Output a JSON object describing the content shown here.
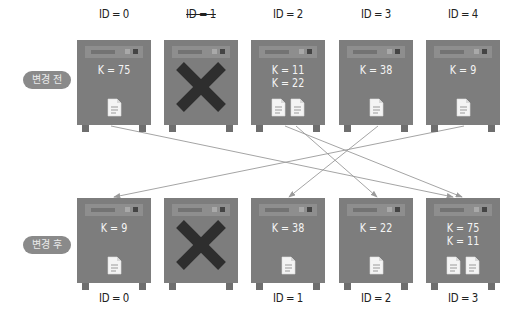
{
  "before": {
    "label": "변경 전",
    "servers": [
      {
        "id_label": "ID = 0",
        "failed": false,
        "keys": [
          "K = 75"
        ],
        "docs": 1
      },
      {
        "id_label": "ID = 1",
        "failed": true,
        "keys": [],
        "docs": 0
      },
      {
        "id_label": "ID = 2",
        "failed": false,
        "keys": [
          "K = 11",
          "K = 22"
        ],
        "docs": 2
      },
      {
        "id_label": "ID = 3",
        "failed": false,
        "keys": [
          "K = 38"
        ],
        "docs": 1
      },
      {
        "id_label": "ID = 4",
        "failed": false,
        "keys": [
          "K = 9"
        ],
        "docs": 1
      }
    ]
  },
  "after": {
    "label": "변경 후",
    "servers": [
      {
        "id_label": "ID = 0",
        "failed": false,
        "keys": [
          "K = 9"
        ],
        "docs": 1
      },
      {
        "id_label": "",
        "failed": true,
        "keys": [],
        "docs": 0
      },
      {
        "id_label": "ID = 1",
        "failed": false,
        "keys": [
          "K = 38"
        ],
        "docs": 1
      },
      {
        "id_label": "ID = 2",
        "failed": false,
        "keys": [
          "K = 22"
        ],
        "docs": 1
      },
      {
        "id_label": "ID = 3",
        "failed": false,
        "keys": [
          "K = 75",
          "K = 11"
        ],
        "docs": 2
      }
    ]
  },
  "migrations": [
    {
      "key": "K = 75",
      "from_slot": 0,
      "to_slot": 4
    },
    {
      "key": "K = 11",
      "from_slot": 2,
      "to_slot": 4
    },
    {
      "key": "K = 22",
      "from_slot": 2,
      "to_slot": 3
    },
    {
      "key": "K = 38",
      "from_slot": 3,
      "to_slot": 2
    },
    {
      "key": "K = 9",
      "from_slot": 4,
      "to_slot": 0
    }
  ],
  "colors": {
    "server_body": "#7d7d7d",
    "fail_mark": "#2e2e2e",
    "arrow": "#9a9a9a",
    "pill": "#8a8a8a"
  }
}
